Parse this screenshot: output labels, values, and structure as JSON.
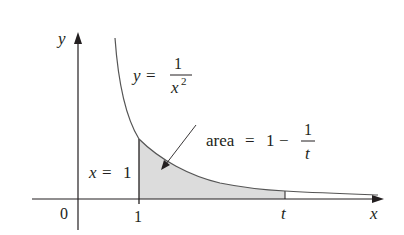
{
  "figure": {
    "function_label": {
      "lhs": "y",
      "eq": "=",
      "num": "1",
      "den_var": "x",
      "den_exp": "2"
    },
    "area_label": {
      "word": "area",
      "eq": "=",
      "one": "1",
      "minus": "−",
      "num": "1",
      "den": "t"
    },
    "vertical_line_label": {
      "var": "x",
      "eq": "=",
      "val": "1"
    },
    "axes": {
      "x_label": "x",
      "y_label": "y",
      "origin_label": "0",
      "tick_1_label": "1",
      "tick_t_label": "t"
    },
    "colors": {
      "ink": "#231f20",
      "curve": "#555555",
      "shade": "#dcdcdc"
    }
  }
}
